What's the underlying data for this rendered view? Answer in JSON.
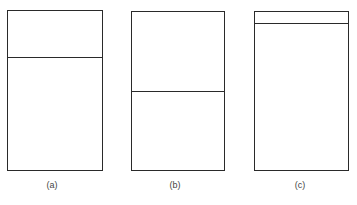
{
  "figure": {
    "panels": [
      {
        "id": "a",
        "label": "(a)",
        "divider_fraction": 0.29
      },
      {
        "id": "b",
        "label": "(b)",
        "divider_fraction": 0.5
      },
      {
        "id": "c",
        "label": "(c)",
        "divider_fraction": 0.075
      }
    ]
  }
}
